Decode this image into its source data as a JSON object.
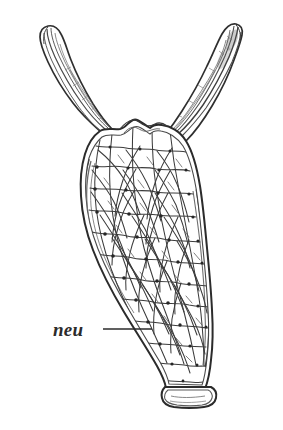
{
  "figure": {
    "background_color": "#ffffff",
    "ink_color": "#3a3a3a",
    "outline_color": "#2f2f2f",
    "label_color": "#2b2b2b",
    "width": 283,
    "height": 430
  },
  "labels": [
    {
      "id": "neu",
      "text": "neu",
      "meaning": "neural net (nerve net layer)",
      "x": 53,
      "y": 334,
      "leader_line": {
        "x1": 103,
        "y1": 329,
        "x2": 152,
        "y2": 329
      }
    }
  ],
  "structures": [
    {
      "name": "left-arm",
      "description": "upper-left tapering tentacle-like arm with rounded hooked tip"
    },
    {
      "name": "right-arm",
      "description": "upper-right tapering tentacle-like arm with blunt dark tip"
    },
    {
      "name": "body-column",
      "description": "elongate column widening below the arms and narrowing toward the base"
    },
    {
      "name": "crest",
      "description": "lumpy wavy crest along the top margin between the arms"
    },
    {
      "name": "pedal-disc",
      "description": "flattened rounded basal foot at the bottom"
    },
    {
      "name": "nerve-net-mesh",
      "description": "irregular polygonal network of nerve fibres with dark nodes at junctions"
    }
  ],
  "geometry": {
    "body_outline_outer": "M150,128 C143,124 138,118 133,120 C128,122 126,128 120,129 C113,130 106,127 100,131 C93,136 88,144 85,154 C81,167 80,181 81,196 C82,214 86,232 93,250 C101,271 112,292 124,312 C136,332 148,350 157,366 C162,375 165,382 166,388 L205,389 C208,381 210,371 211,360 C213,344 213,327 212,310 C211,289 209,268 207,248 C205,226 203,205 200,186 C197,168 193,152 186,141 C180,131 170,126 162,125 C157,124 153,125 150,128 Z",
    "body_outline_inner": "M150,134 C144,130 139,125 134,127 C129,129 127,134 121,135 C114,136 108,133 102,137 C96,142 92,149 89,158 C86,170 85,183 86,197 C87,214 91,231 98,249 C106,269 117,290 129,310 C140,329 151,347 160,362 C165,371 168,378 169,384 L202,385 C205,377 206,368 207,358 C209,342 209,326 208,310 C207,290 205,269 203,249 C201,228 199,207 196,188 C193,171 189,156 183,146 C177,137 168,132 161,131 C156,130 153,131 150,134 Z",
    "left_arm_outer": "M100,131 C92,124 82,115 73,103 C63,90 54,75 48,62 C43,51 40,43 40,37 C40,31 43,27 48,26 C53,25 58,28 61,34 C65,41 67,50 71,60 C76,73 84,89 93,104 C100,115 107,124 112,129 Z",
    "left_arm_mid": "M98,133 C90,127 81,118 72,106 C62,93 54,79 49,66 C45,56 43,48 43,41 C43,36 45,32 49,31 C53,30 57,33 60,39 C63,46 65,55 69,64 C74,77 82,92 90,106 C97,117 104,126 109,131 Z",
    "right_arm_outer": "M186,141 C194,133 203,121 212,106 C221,91 229,74 234,60 C238,49 241,41 242,35 C243,29 241,25 236,24 C231,23 226,27 222,34 C217,43 213,54 207,66 C200,81 191,97 182,111 C175,122 169,130 165,135 Z",
    "right_arm_mid": "M184,144 C192,136 200,124 209,110 C218,95 225,79 230,66 C234,55 237,47 238,41 C239,36 237,32 233,31 C229,30 225,34 221,41 C216,50 212,60 207,71 C200,86 191,101 182,114 C176,124 171,132 167,137 Z",
    "pedal_disc_outer": "M165,387 C162,390 161,394 162,398 C163,403 167,406 174,407 C183,408 196,408 204,407 C211,406 215,403 216,398 C217,393 215,389 211,387 Z",
    "pedal_disc_inner": "M168,390 C165,392 164,396 165,399 C167,403 171,404 177,405 C185,406 195,406 202,405 C208,404 211,402 212,398 C213,395 211,391 208,390 Z"
  },
  "mesh": {
    "description": "Irregular polygonal nerve-net fibres filling the body column and extending into the arm bases",
    "node_count": 58,
    "fiber_color": "#3c3c3c",
    "node_color": "#262626"
  }
}
